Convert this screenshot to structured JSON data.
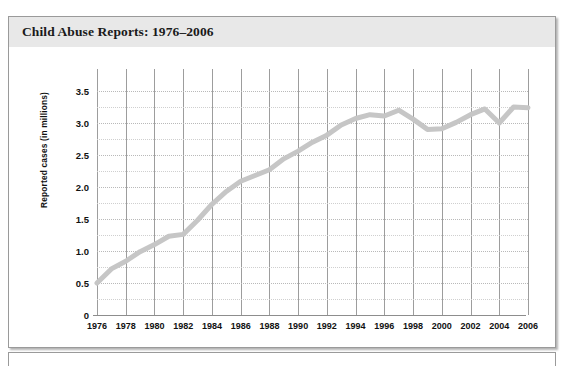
{
  "figure": {
    "title": "Child Abuse Reports: 1976–2006",
    "title_band_color": "#e8e8e8",
    "frame_border_color": "#9a9a9a",
    "background_color": "#ffffff"
  },
  "chart_data": {
    "type": "line",
    "title": "Child Abuse Reports: 1976–2006",
    "xlabel": "",
    "ylabel": "Reported cases (in millions)",
    "xlim": [
      1976,
      2006
    ],
    "ylim": [
      0,
      3.5
    ],
    "grid": "vertical solid gray at every labeled year; horizontal dotted gray at every 0.25",
    "legend": "none",
    "series_color": "#c6c6c6",
    "line_width_px": 5,
    "x_tick_labels": [
      "1976",
      "1978",
      "1980",
      "1982",
      "1984",
      "1986",
      "1988",
      "1990",
      "1992",
      "1994",
      "1996",
      "1998",
      "2000",
      "2002",
      "2004",
      "2006"
    ],
    "y_tick_labels": [
      "0",
      "0.5",
      "1.0",
      "1.5",
      "2.0",
      "2.5",
      "3.0",
      "3.5"
    ],
    "y_ticks": [
      0,
      0.5,
      1.0,
      1.5,
      2.0,
      2.5,
      3.0,
      3.5
    ],
    "x": [
      1976,
      1977,
      1978,
      1979,
      1980,
      1981,
      1982,
      1983,
      1984,
      1985,
      1986,
      1987,
      1988,
      1989,
      1990,
      1991,
      1992,
      1993,
      1994,
      1995,
      1996,
      1997,
      1998,
      1999,
      2000,
      2001,
      2002,
      2003,
      2004,
      2005,
      2006
    ],
    "series": [
      {
        "name": "Reported cases (in millions)",
        "values": [
          0.5,
          0.72,
          0.84,
          0.99,
          1.1,
          1.23,
          1.26,
          1.48,
          1.73,
          1.93,
          2.09,
          2.18,
          2.27,
          2.44,
          2.56,
          2.7,
          2.81,
          2.97,
          3.07,
          3.13,
          3.11,
          3.2,
          3.06,
          2.9,
          2.91,
          3.01,
          3.13,
          3.22,
          3.0,
          3.25,
          3.24
        ]
      }
    ]
  }
}
